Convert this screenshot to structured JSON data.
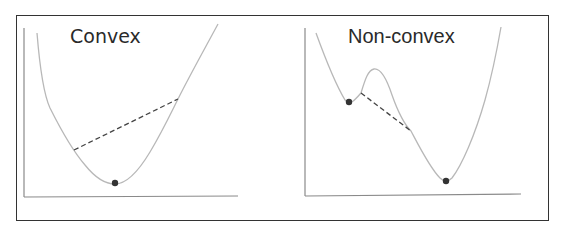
{
  "panels": [
    {
      "title": "Convex",
      "curve": "convex-bowl",
      "minima": [
        {
          "label": "global-minimum",
          "x": 115,
          "y": 183
        }
      ],
      "chord": {
        "from": [
          74,
          150
        ],
        "to": [
          178,
          99
        ],
        "style": "dashed"
      }
    },
    {
      "title": "Non-convex",
      "curve": "double-well",
      "minima": [
        {
          "label": "local-minimum",
          "x": 349,
          "y": 102
        },
        {
          "label": "global-minimum",
          "x": 446,
          "y": 181
        }
      ],
      "chord": {
        "from": [
          361,
          93
        ],
        "to": [
          411,
          131
        ],
        "style": "dashed"
      }
    }
  ],
  "colors": {
    "curve": "#b8b8b8",
    "axis": "#8a8a8a",
    "chord": "#444444",
    "dot": "#333333",
    "frame": "#333333"
  }
}
